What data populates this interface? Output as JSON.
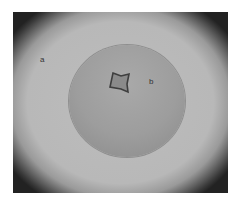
{
  "image": {
    "description": "Microscope view of a crystal inside a droplet",
    "labels": {
      "a": "a",
      "b": "b"
    }
  }
}
